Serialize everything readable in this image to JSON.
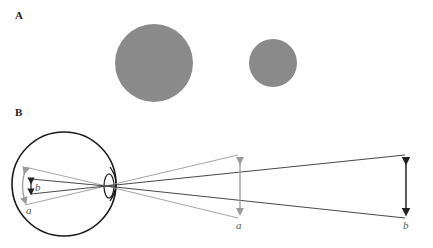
{
  "panels": {
    "a": {
      "label": "A"
    },
    "b": {
      "label": "B"
    }
  },
  "panel_a": {
    "large_circle": {
      "cx": 154,
      "cy": 63,
      "r": 39
    },
    "small_circle": {
      "cx": 273,
      "cy": 63,
      "r": 24
    },
    "fill": "#8a8a8a"
  },
  "panel_b": {
    "object_a_label": "a",
    "object_b_label": "b",
    "retina_a_label": "a",
    "retina_b_label": "b",
    "gray_ray_color": "#9a9a9a",
    "dark_ray_color": "#333333"
  }
}
